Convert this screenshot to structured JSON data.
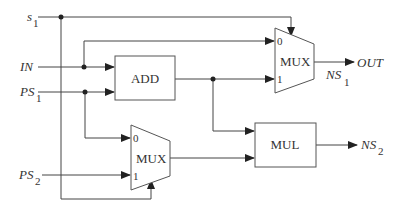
{
  "signals": {
    "s1": {
      "name": "s",
      "sub": "1"
    },
    "in": {
      "name": "IN"
    },
    "ps1": {
      "name": "PS",
      "sub": "1"
    },
    "ps2": {
      "name": "PS",
      "sub": "2"
    },
    "ns1": {
      "name": "NS",
      "sub": "1"
    },
    "ns2": {
      "name": "NS",
      "sub": "2"
    },
    "out": {
      "name": "OUT"
    }
  },
  "blocks": {
    "add": {
      "label": "ADD"
    },
    "mul": {
      "label": "MUL"
    },
    "mux_top": {
      "label": "MUX",
      "in0": "0",
      "in1": "1"
    },
    "mux_bottom": {
      "label": "MUX",
      "in0": "0",
      "in1": "1"
    }
  }
}
